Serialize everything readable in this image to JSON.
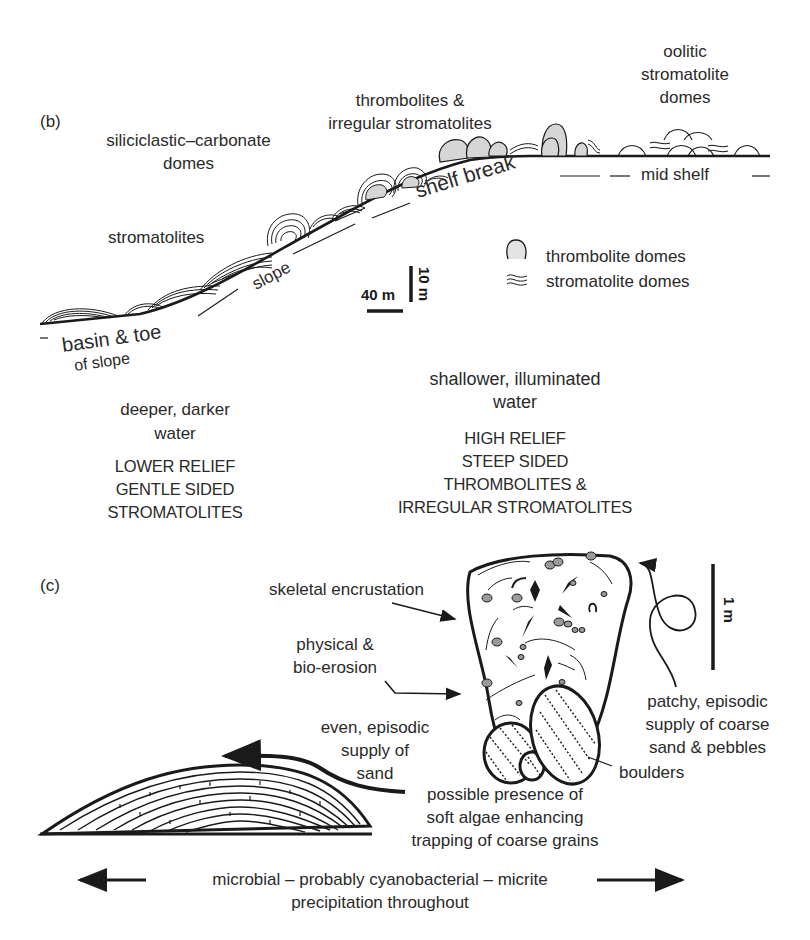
{
  "panel_b": {
    "label": "(b)",
    "zones": {
      "siliciclastic": [
        "siliciclastic–carbonate",
        "domes"
      ],
      "stromatolites": "stromatolites",
      "thrombolites": [
        "thrombolites &",
        "irregular stromatolites"
      ],
      "oolitic": [
        "oolitic",
        "stromatolite",
        "domes"
      ]
    },
    "profile_labels": {
      "shelf_break": "shelf break",
      "slope": "slope",
      "mid_shelf": "mid shelf",
      "basin": [
        "basin & toe",
        "of slope"
      ]
    },
    "scale": {
      "horizontal": "40 m",
      "vertical": "10 m"
    },
    "legend": [
      {
        "icon": "thrombolite-dome-icon",
        "label": "thrombolite domes"
      },
      {
        "icon": "stromatolite-wave-icon",
        "label": "stromatolite domes"
      }
    ],
    "deep": {
      "water": [
        "deeper, darker",
        "water"
      ],
      "character": [
        "LOWER RELIEF",
        "GENTLE SIDED",
        "STROMATOLITES"
      ]
    },
    "shallow": {
      "water": [
        "shallower, illuminated",
        "water"
      ],
      "character": [
        "HIGH RELIEF",
        "STEEP SIDED",
        "THROMBOLITES &",
        "IRREGULAR STROMATOLITES"
      ]
    }
  },
  "panel_c": {
    "label": "(c)",
    "annotations": {
      "skeletal": "skeletal encrustation",
      "erosion": [
        "physical &",
        "bio-erosion"
      ],
      "sand_supply": [
        "even, episodic",
        "supply of",
        "sand"
      ],
      "coarse_supply": [
        "patchy, episodic",
        "supply of coarse",
        "sand & pebbles"
      ],
      "boulders": "boulders",
      "algae": [
        "possible presence of",
        "soft algae enhancing",
        "trapping of coarse grains"
      ]
    },
    "scale": {
      "vertical": "1 m"
    },
    "footer": [
      "microbial – probably cyanobacterial – micrite",
      "precipitation throughout"
    ]
  },
  "colors": {
    "ink": "#1a1a1a",
    "text": "#2a2a2a",
    "fill_gray": "#d6d6d6",
    "clast_gray": "#9a9a9a"
  }
}
